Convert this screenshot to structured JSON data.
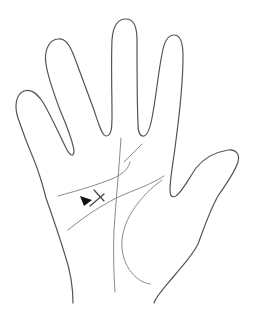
{
  "diagram": {
    "outline_color": "#555555",
    "line_color": "#8a8a8a",
    "marker_color": "#111111",
    "annotations": {
      "arrow_marker": "▶",
      "cross_marker": "×"
    }
  }
}
